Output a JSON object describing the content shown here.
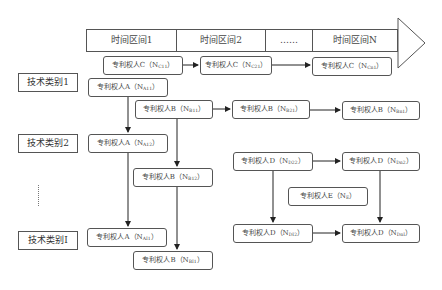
{
  "timeline": {
    "intervals": [
      {
        "label": "时间区间1"
      },
      {
        "label": "时间区间2"
      },
      {
        "label": "……"
      },
      {
        "label": "时间区间N"
      }
    ]
  },
  "categories": [
    {
      "label": "技术类别1"
    },
    {
      "label": "技术类别2"
    },
    {
      "label": "技术类别I"
    }
  ],
  "ellipsis": "⋮",
  "nodes": {
    "c11": {
      "prefix": "专利权人C（N",
      "sub": "C11",
      "suffix": "）"
    },
    "c21": {
      "prefix": "专利权人C（N",
      "sub": "C21",
      "suffix": "）"
    },
    "cn1": {
      "prefix": "专利权人C（N",
      "sub": "Cn1",
      "suffix": "）"
    },
    "a11": {
      "prefix": "专利权人A（N",
      "sub": "A11",
      "suffix": "）"
    },
    "b11": {
      "prefix": "专利权人B（N",
      "sub": "B11",
      "suffix": "）"
    },
    "b21": {
      "prefix": "专利权人B（N",
      "sub": "B21",
      "suffix": "）"
    },
    "bn1": {
      "prefix": "专利权人B（N",
      "sub": "Bn1",
      "suffix": "）"
    },
    "a12": {
      "prefix": "专利权人A（N",
      "sub": "A12",
      "suffix": "）"
    },
    "b12": {
      "prefix": "专利权人B（N",
      "sub": "B12",
      "suffix": "）"
    },
    "d22": {
      "prefix": "专利权人D（N",
      "sub": "D22",
      "suffix": "）"
    },
    "dn2": {
      "prefix": "专利权人D（N",
      "sub": "Dn2",
      "suffix": "）"
    },
    "e": {
      "prefix": "专利权人E（N",
      "sub": "E",
      "suffix": "）"
    },
    "ai1": {
      "prefix": "专利权人A（N",
      "sub": "AI1",
      "suffix": "）"
    },
    "bi1": {
      "prefix": "专利权人B（N",
      "sub": "BI1",
      "suffix": "）"
    },
    "di2": {
      "prefix": "专利权人D（N",
      "sub": "DI2",
      "suffix": "）"
    },
    "dni": {
      "prefix": "专利权人D（N",
      "sub": "DnI",
      "suffix": "）"
    }
  }
}
